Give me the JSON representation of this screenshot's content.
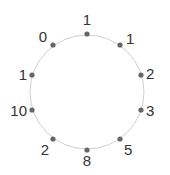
{
  "diagram": {
    "type": "circular-node-ring",
    "circle": {
      "cx": 87,
      "cy": 92,
      "r": 57,
      "stroke": "#d0d0d0"
    },
    "dot_color": "#666666",
    "nodes": [
      {
        "label": "1",
        "x": 87,
        "y": 34,
        "lx": 87,
        "ly": 25,
        "anchor": "middle"
      },
      {
        "label": "1",
        "x": 120,
        "y": 45,
        "lx": 126,
        "ly": 44,
        "anchor": "start"
      },
      {
        "label": "2",
        "x": 141,
        "y": 75,
        "lx": 146,
        "ly": 79,
        "anchor": "start"
      },
      {
        "label": "3",
        "x": 141,
        "y": 110,
        "lx": 146,
        "ly": 116,
        "anchor": "start"
      },
      {
        "label": "5",
        "x": 120,
        "y": 139,
        "lx": 124,
        "ly": 155,
        "anchor": "start"
      },
      {
        "label": "8",
        "x": 87,
        "y": 150,
        "lx": 87,
        "ly": 166,
        "anchor": "middle"
      },
      {
        "label": "2",
        "x": 53,
        "y": 139,
        "lx": 49,
        "ly": 155,
        "anchor": "end"
      },
      {
        "label": "10",
        "x": 32,
        "y": 110,
        "lx": 27,
        "ly": 116,
        "anchor": "end"
      },
      {
        "label": "1",
        "x": 32,
        "y": 75,
        "lx": 27,
        "ly": 80,
        "anchor": "end"
      },
      {
        "label": "0",
        "x": 53,
        "y": 45,
        "lx": 47,
        "ly": 42,
        "anchor": "end"
      }
    ]
  }
}
